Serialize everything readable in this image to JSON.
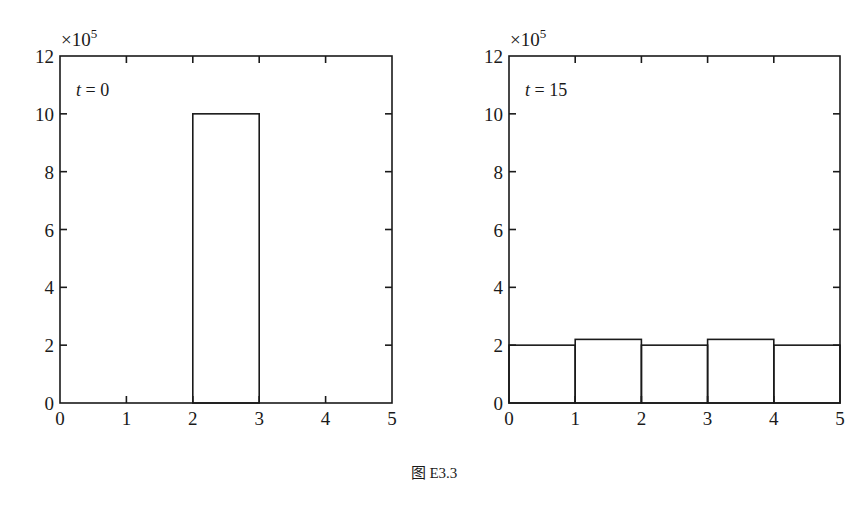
{
  "chart_data": [
    {
      "type": "bar",
      "panel": "left",
      "annotation": "t = 0",
      "annotation_var": "t",
      "annotation_val": "= 0",
      "multiplier_label": "×10",
      "multiplier_exp": "5",
      "bins": [
        [
          0,
          1
        ],
        [
          1,
          2
        ],
        [
          2,
          3
        ],
        [
          3,
          4
        ],
        [
          4,
          5
        ]
      ],
      "categories": [
        "0-1",
        "1-2",
        "2-3",
        "3-4",
        "4-5"
      ],
      "values": [
        0,
        0,
        10,
        0,
        0
      ],
      "scale": 100000,
      "xlim": [
        0,
        5
      ],
      "ylim": [
        0,
        12
      ],
      "xticks": [
        "0",
        "1",
        "2",
        "3",
        "4",
        "5"
      ],
      "yticks": [
        "0",
        "2",
        "4",
        "6",
        "8",
        "10",
        "12"
      ],
      "xlabel": "",
      "ylabel": "",
      "grid": false
    },
    {
      "type": "bar",
      "panel": "right",
      "annotation": "t = 15",
      "annotation_var": "t",
      "annotation_val": "= 15",
      "multiplier_label": "×10",
      "multiplier_exp": "5",
      "bins": [
        [
          0,
          1
        ],
        [
          1,
          2
        ],
        [
          2,
          3
        ],
        [
          3,
          4
        ],
        [
          4,
          5
        ]
      ],
      "categories": [
        "0-1",
        "1-2",
        "2-3",
        "3-4",
        "4-5"
      ],
      "values": [
        2.0,
        2.2,
        2.0,
        2.2,
        2.0
      ],
      "scale": 100000,
      "xlim": [
        0,
        5
      ],
      "ylim": [
        0,
        12
      ],
      "xticks": [
        "0",
        "1",
        "2",
        "3",
        "4",
        "5"
      ],
      "yticks": [
        "0",
        "2",
        "4",
        "6",
        "8",
        "10",
        "12"
      ],
      "xlabel": "",
      "ylabel": "",
      "grid": false
    }
  ],
  "caption": "图 E3.3"
}
